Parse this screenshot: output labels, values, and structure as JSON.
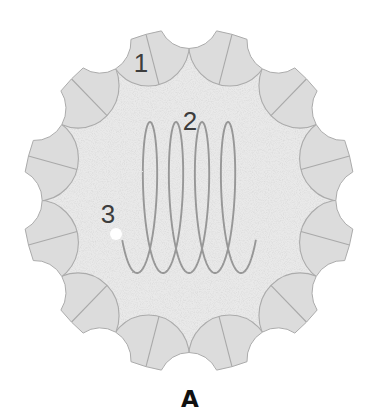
{
  "diagram": {
    "panel_label": {
      "text": "A",
      "x": 190,
      "y": 407
    },
    "labels": [
      {
        "text": "1",
        "x": 141,
        "y": 71.5
      },
      {
        "text": "2",
        "x": 190,
        "y": 130
      },
      {
        "text": "3",
        "x": 108,
        "y": 223
      }
    ]
  },
  "gear": {
    "cx": 189,
    "cy": 200.5,
    "sx": 0.966,
    "outer_r": 172,
    "teeth": 12,
    "tooth_start_deg": -75,
    "tooth_center_r": 162.5,
    "tooth_r": 42.5,
    "scallop_start_deg": -90,
    "scallop_center_r": 184,
    "scallop_r": 32
  },
  "curve": {
    "x0": 137,
    "p": 4.14,
    "q": 13,
    "yc": 197.5,
    "h": 75.5,
    "t_start": -0.97,
    "t_end": 26.13,
    "loops": 4
  },
  "marker": {
    "x": 116,
    "y": 234,
    "r": 6
  },
  "colors": {
    "body_fill": "#e9e9e9",
    "tooth_fill": "#dcdcdc",
    "edge": "#ababab",
    "divider": "#a9a9a9",
    "curve": "#979797",
    "marker": "#ffffff"
  }
}
